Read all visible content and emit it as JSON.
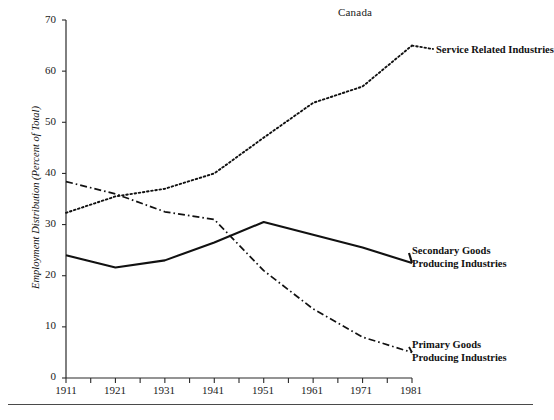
{
  "chart_data": {
    "type": "line",
    "title": "Canada",
    "xlabel": "",
    "ylabel": "Employment Distribution (Percent of Total)",
    "x": [
      1911,
      1921,
      1931,
      1941,
      1951,
      1961,
      1971,
      1981
    ],
    "xtick_labels": [
      "1911",
      "1921",
      "1931",
      "1941",
      "1951",
      "1961",
      "1971",
      "1981"
    ],
    "ytick_labels": [
      "0",
      "10",
      "20",
      "30",
      "40",
      "50",
      "60",
      "70"
    ],
    "ytick_values": [
      0,
      10,
      20,
      30,
      40,
      50,
      60,
      70
    ],
    "xlim": [
      1911,
      1981
    ],
    "ylim": [
      0,
      70
    ],
    "grid": false,
    "legend_position": "right-inline-labels",
    "minor_x_ticks": true,
    "series": [
      {
        "name": "Service Related Industries",
        "label_lines": [
          "Service Related Industries"
        ],
        "style": "dotted",
        "color": "#111111",
        "values": [
          32.3,
          35.5,
          37.0,
          40.0,
          47.0,
          53.8,
          57.0,
          65.0
        ]
      },
      {
        "name": "Secondary Goods Producing Industries",
        "label_lines": [
          "Secondary Goods",
          "Producing Industries"
        ],
        "style": "solid",
        "color": "#111111",
        "values": [
          24.0,
          21.6,
          23.0,
          26.5,
          30.5,
          28.0,
          25.5,
          22.5
        ]
      },
      {
        "name": "Primary Goods Producing Industries",
        "label_lines": [
          "Primary Goods",
          "Producing Industries"
        ],
        "style": "dashdot",
        "color": "#111111",
        "values": [
          38.4,
          36.0,
          32.5,
          31.0,
          21.0,
          13.5,
          8.0,
          5.0
        ]
      }
    ]
  },
  "axis": {
    "y_title": "Employment Distribution (Percent of Total)",
    "y_ticks": [
      "70",
      "60",
      "50",
      "40",
      "30",
      "20",
      "10",
      "0"
    ],
    "x_ticks": [
      "1911",
      "1921",
      "1931",
      "1941",
      "1951",
      "1961",
      "1971",
      "1981"
    ]
  },
  "labels": {
    "service_line1": "Service Related Industries",
    "secondary_line1": "Secondary Goods",
    "secondary_line2": "Producing Industries",
    "primary_line1": "Primary Goods",
    "primary_line2": "Producing Industries"
  }
}
